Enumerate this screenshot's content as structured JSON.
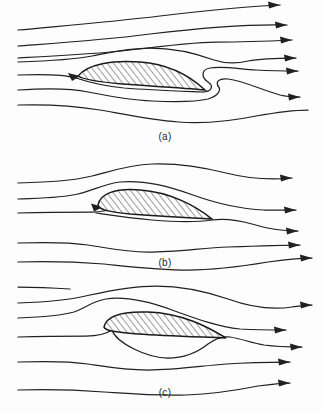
{
  "figure": {
    "background_color": "#fdfdfd",
    "line_color": "#231f20",
    "width": 322,
    "height": 413
  },
  "panels": [
    {
      "id": "a",
      "label": "(a)",
      "label_x": 165,
      "label_y": 140,
      "description": "Flow over airfoil at angle of attack with starting vortex S-curve at trailing edge",
      "airfoil": {
        "hatched": true,
        "hatch_direction": "lower-left-to-upper-right",
        "leading_edge_x": 78,
        "leading_edge_y": 76,
        "trailing_edge_x": 205,
        "trailing_edge_y": 90,
        "angle_of_attack_deg": 6
      },
      "stagnation_arrow": true,
      "streamline_count": 7,
      "right_arrow_count": 6,
      "arrow_y_positions": [
        6,
        26,
        41,
        58,
        72,
        97
      ]
    },
    {
      "id": "b",
      "label": "(b)",
      "label_x": 165,
      "label_y": 266,
      "description": "Flow over airfoil with smooth streamlines and leading edge stagnation point",
      "airfoil": {
        "hatched": true,
        "hatch_direction": "lower-left-to-upper-right",
        "leading_edge_x": 98,
        "leading_edge_y": 205,
        "trailing_edge_x": 212,
        "trailing_edge_y": 219,
        "angle_of_attack_deg": 5
      },
      "stagnation_arrow": true,
      "streamline_count": 5,
      "right_arrow_count": 4,
      "arrow_y_positions": [
        178,
        210,
        243,
        259
      ]
    },
    {
      "id": "c",
      "label": "(c)",
      "label_x": 165,
      "label_y": 396,
      "description": "Flow over airfoil with fully established circulation and smooth trailing edge flow",
      "airfoil": {
        "hatched": true,
        "hatch_direction": "lower-left-to-upper-right",
        "leading_edge_x": 104,
        "leading_edge_y": 327,
        "trailing_edge_x": 226,
        "trailing_edge_y": 338,
        "angle_of_attack_deg": 4
      },
      "stagnation_arrow": false,
      "streamline_count": 5,
      "right_arrow_count": 4,
      "arrow_y_positions": [
        317,
        346,
        363,
        383
      ]
    }
  ]
}
